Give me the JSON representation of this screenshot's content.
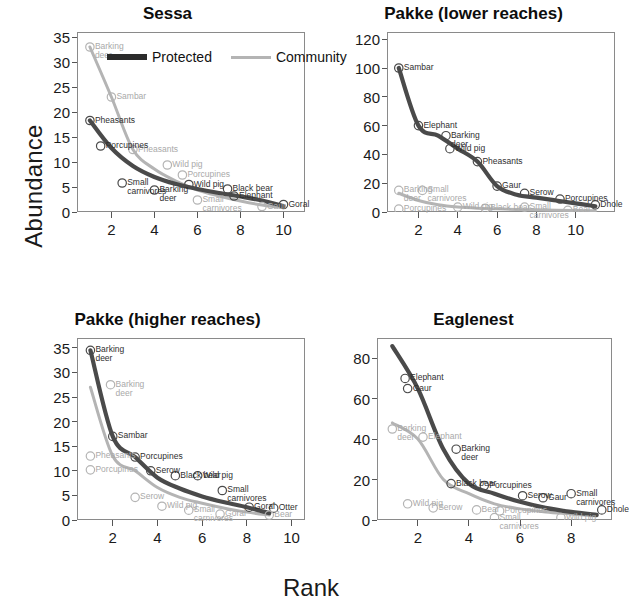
{
  "figure": {
    "ylabel": "Abundance",
    "xlabel": "Rank",
    "legend": [
      {
        "label": "Protected",
        "color": "#2b2b2b",
        "style": "thick-dark"
      },
      {
        "label": "Community",
        "color": "#b4b4b4",
        "style": "thin-light"
      }
    ]
  },
  "chart_data": [
    {
      "type": "line",
      "title": "Sessa",
      "xlabel": "Rank",
      "ylabel": "Abundance",
      "xlim": [
        0.4,
        11.0
      ],
      "ylim": [
        0,
        36
      ],
      "xticks": [
        2,
        4,
        6,
        8,
        10
      ],
      "yticks": [
        0,
        5,
        10,
        15,
        20,
        25,
        30,
        35
      ],
      "grid": false,
      "legend_position": "top-center",
      "series": [
        {
          "name": "Protected",
          "color": "#4a4a4a",
          "x": [
            1,
            2,
            3,
            4,
            5,
            6,
            7,
            8,
            9,
            10
          ],
          "values": [
            18.3,
            12.8,
            9.2,
            7.0,
            5.6,
            4.6,
            3.8,
            3.1,
            2.3,
            1.2
          ],
          "point_labels": [
            "Pheasants",
            "Porcupines",
            "Small carnivores",
            "Barking deer",
            "Wild pig",
            "Black bear",
            "Elephant",
            "Goral"
          ]
        },
        {
          "name": "Community",
          "color": "#b4b4b4",
          "x": [
            1,
            2,
            3,
            4,
            5,
            6,
            7,
            8,
            9,
            10
          ],
          "values": [
            33.0,
            23.0,
            12.5,
            8.6,
            6.2,
            4.4,
            3.2,
            2.2,
            1.4,
            0.9
          ],
          "point_labels": [
            "Barking deer",
            "Sambar",
            "Pheasants",
            "Wild pig",
            "Porcupines",
            "Small carnivores",
            "Gaur"
          ]
        }
      ],
      "annotations": [
        {
          "text": "Barking deer",
          "series": "Community",
          "x": 1,
          "y": 33.0
        },
        {
          "text": "Sambar",
          "series": "Community",
          "x": 2,
          "y": 23.0
        },
        {
          "text": "Pheasants",
          "series": "Community",
          "x": 3,
          "y": 12.5
        },
        {
          "text": "Wild pig",
          "series": "Community",
          "x": 4.6,
          "y": 9.4
        },
        {
          "text": "Porcupines",
          "series": "Community",
          "x": 5.3,
          "y": 7.4
        },
        {
          "text": "Small carnivores",
          "series": "Community",
          "x": 6,
          "y": 2.4
        },
        {
          "text": "Gaur",
          "series": "Community",
          "x": 9,
          "y": 1.1
        },
        {
          "text": "Pheasants",
          "series": "Protected",
          "x": 1,
          "y": 18.3
        },
        {
          "text": "Porcupines",
          "series": "Protected",
          "x": 1.5,
          "y": 13.2
        },
        {
          "text": "Small carnivores",
          "series": "Protected",
          "x": 2.5,
          "y": 5.8
        },
        {
          "text": "Barking deer",
          "series": "Protected",
          "x": 4,
          "y": 4.4
        },
        {
          "text": "Wild pig",
          "series": "Protected",
          "x": 5.6,
          "y": 5.5
        },
        {
          "text": "Black bear",
          "series": "Protected",
          "x": 7.4,
          "y": 4.6
        },
        {
          "text": "Elephant",
          "series": "Protected",
          "x": 7.7,
          "y": 3.2
        },
        {
          "text": "Goral",
          "series": "Protected",
          "x": 10,
          "y": 1.5
        }
      ]
    },
    {
      "type": "line",
      "title": "Pakke (lower reaches)",
      "xlabel": "Rank",
      "ylabel": "Abundance",
      "xlim": [
        0.4,
        12.0
      ],
      "ylim": [
        0,
        125
      ],
      "xticks": [
        2,
        4,
        6,
        8,
        10
      ],
      "yticks": [
        0,
        20,
        40,
        60,
        80,
        100,
        120
      ],
      "grid": false,
      "series": [
        {
          "name": "Protected",
          "color": "#4a4a4a",
          "x": [
            1,
            2,
            3,
            4,
            5,
            6,
            7,
            8,
            9,
            10,
            11
          ],
          "values": [
            100,
            60,
            53,
            44,
            35,
            18,
            12,
            10,
            8,
            6,
            4
          ],
          "point_labels": [
            "Sambar",
            "Elephant",
            "Barking deer",
            "Wild pig",
            "Pheasants",
            "Gaur",
            "Serow",
            "Porcupines",
            "Dhole"
          ]
        },
        {
          "name": "Community",
          "color": "#b4b4b4",
          "x": [
            1,
            2,
            3,
            4,
            5,
            6,
            7,
            8,
            9,
            10,
            11
          ],
          "values": [
            13,
            8,
            5,
            3.4,
            2.6,
            2.2,
            1.8,
            1.5,
            1.2,
            1.0,
            0.8
          ],
          "point_labels": [
            "Barking deer",
            "Small carnivores",
            "Porcupines",
            "Wild pig",
            "Black bear",
            "Small carnivores",
            "Bear"
          ]
        }
      ],
      "annotations": [
        {
          "text": "Sambar",
          "series": "Protected",
          "x": 1,
          "y": 100
        },
        {
          "text": "Elephant",
          "series": "Protected",
          "x": 2,
          "y": 60
        },
        {
          "text": "Barking deer",
          "series": "Protected",
          "x": 3.4,
          "y": 53
        },
        {
          "text": "Wild pig",
          "series": "Protected",
          "x": 3.6,
          "y": 44
        },
        {
          "text": "Pheasants",
          "series": "Protected",
          "x": 5,
          "y": 35
        },
        {
          "text": "Gaur",
          "series": "Protected",
          "x": 6,
          "y": 18
        },
        {
          "text": "Serow",
          "series": "Protected",
          "x": 7.4,
          "y": 13
        },
        {
          "text": "Porcupines",
          "series": "Protected",
          "x": 9.2,
          "y": 9
        },
        {
          "text": "Dhole",
          "series": "Protected",
          "x": 11,
          "y": 5
        },
        {
          "text": "Barking deer",
          "series": "Community",
          "x": 1,
          "y": 15
        },
        {
          "text": "Small carnivores",
          "series": "Community",
          "x": 2.2,
          "y": 15
        },
        {
          "text": "Porcupines",
          "series": "Community",
          "x": 1,
          "y": 2.0
        },
        {
          "text": "Wild pig",
          "series": "Community",
          "x": 4,
          "y": 3.4
        },
        {
          "text": "Black bear",
          "series": "Community",
          "x": 5.4,
          "y": 2.6
        },
        {
          "text": "Small carnivores",
          "series": "Community",
          "x": 7.4,
          "y": 3.4
        },
        {
          "text": "Bear",
          "series": "Community",
          "x": 9.6,
          "y": 1.2
        }
      ]
    },
    {
      "type": "line",
      "title": "Pakke (higher reaches)",
      "xlabel": "Rank",
      "ylabel": "Abundance",
      "xlim": [
        0.4,
        10.6
      ],
      "ylim": [
        0,
        37
      ],
      "xticks": [
        2,
        4,
        6,
        8,
        10
      ],
      "yticks": [
        0,
        5,
        10,
        15,
        20,
        25,
        30,
        35
      ],
      "grid": false,
      "series": [
        {
          "name": "Protected",
          "color": "#4a4a4a",
          "x": [
            1,
            2,
            3,
            4,
            5,
            6,
            7,
            8,
            9
          ],
          "values": [
            34.5,
            17.0,
            12.8,
            8.6,
            6.4,
            4.8,
            3.6,
            2.6,
            1.4
          ],
          "point_labels": [
            "Barking deer",
            "Sambar",
            "Porcupines",
            "Serow",
            "Black bear",
            "Wild pig",
            "Small carnivores",
            "Goral",
            "Otter"
          ]
        },
        {
          "name": "Community",
          "color": "#b4b4b4",
          "x": [
            1,
            2,
            3,
            4,
            5,
            6,
            7,
            8,
            9
          ],
          "values": [
            27.0,
            13.0,
            10.0,
            6.6,
            4.6,
            3.4,
            2.4,
            1.6,
            1.0
          ],
          "point_labels": [
            "Barking deer",
            "Pheasants",
            "Porcupines",
            "Serow",
            "Wild pig",
            "Small carnivores",
            "Goral",
            "Bear"
          ]
        }
      ],
      "annotations": [
        {
          "text": "Barking deer",
          "series": "Protected",
          "x": 1,
          "y": 34.5
        },
        {
          "text": "Barking deer",
          "series": "Community",
          "x": 1.9,
          "y": 27.5
        },
        {
          "text": "Sambar",
          "series": "Protected",
          "x": 2,
          "y": 17.0
        },
        {
          "text": "Pheasants",
          "series": "Community",
          "x": 1,
          "y": 13.0
        },
        {
          "text": "Porcupines",
          "series": "Protected",
          "x": 3,
          "y": 12.8
        },
        {
          "text": "Porcupines",
          "series": "Community",
          "x": 1,
          "y": 10.2
        },
        {
          "text": "Serow",
          "series": "Protected",
          "x": 3.7,
          "y": 10.0
        },
        {
          "text": "Black bear",
          "series": "Protected",
          "x": 4.8,
          "y": 9.0
        },
        {
          "text": "Wild pig",
          "series": "Protected",
          "x": 5.8,
          "y": 9.0
        },
        {
          "text": "Small carnivores",
          "series": "Protected",
          "x": 6.9,
          "y": 6.0
        },
        {
          "text": "Serow",
          "series": "Community",
          "x": 3.0,
          "y": 4.6
        },
        {
          "text": "Wild pig",
          "series": "Community",
          "x": 4.2,
          "y": 2.8
        },
        {
          "text": "Small carnivores",
          "series": "Community",
          "x": 5.4,
          "y": 2.0
        },
        {
          "text": "Goral",
          "series": "Community",
          "x": 6.8,
          "y": 1.2
        },
        {
          "text": "Goral",
          "series": "Protected",
          "x": 8.1,
          "y": 2.6
        },
        {
          "text": "Otter",
          "series": "Protected",
          "x": 9.2,
          "y": 2.4
        },
        {
          "text": "Bear",
          "series": "Community",
          "x": 9.0,
          "y": 1.0
        }
      ]
    },
    {
      "type": "line",
      "title": "Eaglenest",
      "xlabel": "Rank",
      "ylabel": "Abundance",
      "xlim": [
        0.4,
        9.6
      ],
      "ylim": [
        0,
        90
      ],
      "xticks": [
        2,
        4,
        6,
        8
      ],
      "yticks": [
        0,
        20,
        40,
        60,
        80
      ],
      "grid": false,
      "series": [
        {
          "name": "Protected",
          "color": "#4a4a4a",
          "x": [
            1,
            2,
            3,
            4,
            5,
            6,
            7,
            8,
            9
          ],
          "values": [
            86,
            65,
            35,
            18,
            13,
            9,
            6,
            4,
            2.5
          ],
          "point_labels": [
            "Elephant",
            "Gaur",
            "Barking deer",
            "Black bear",
            "Porcupines",
            "Serow",
            "Gaur",
            "Small carnivores",
            "Dhole"
          ]
        },
        {
          "name": "Community",
          "color": "#b4b4b4",
          "x": [
            1,
            2,
            3,
            4,
            5,
            6,
            7,
            8,
            9
          ],
          "values": [
            48,
            40,
            20,
            13,
            8,
            5.5,
            4,
            3,
            2
          ],
          "point_labels": [
            "Barking deer",
            "Elephant",
            "Wild pig",
            "Serow",
            "Bear",
            "Porcupines",
            "Small carnivores",
            "Wild pig"
          ]
        }
      ],
      "annotations": [
        {
          "text": "Elephant",
          "series": "Protected",
          "x": 1.5,
          "y": 70
        },
        {
          "text": "Gaur",
          "series": "Protected",
          "x": 1.6,
          "y": 65
        },
        {
          "text": "Barking deer",
          "series": "Protected",
          "x": 3.5,
          "y": 35
        },
        {
          "text": "Barking deer",
          "series": "Community",
          "x": 1,
          "y": 45
        },
        {
          "text": "Elephant",
          "series": "Community",
          "x": 2.2,
          "y": 41
        },
        {
          "text": "Black bear",
          "series": "Protected",
          "x": 3.3,
          "y": 18
        },
        {
          "text": "Porcupines",
          "series": "Protected",
          "x": 4.6,
          "y": 17
        },
        {
          "text": "Serow",
          "series": "Protected",
          "x": 6.1,
          "y": 12
        },
        {
          "text": "Gaur",
          "series": "Protected",
          "x": 6.9,
          "y": 11
        },
        {
          "text": "Small carnivores",
          "series": "Protected",
          "x": 8.0,
          "y": 13
        },
        {
          "text": "Dhole",
          "series": "Protected",
          "x": 9.2,
          "y": 5
        },
        {
          "text": "Wild pig",
          "series": "Community",
          "x": 1.6,
          "y": 8
        },
        {
          "text": "Serow",
          "series": "Community",
          "x": 2.6,
          "y": 6
        },
        {
          "text": "Bear",
          "series": "Community",
          "x": 4.3,
          "y": 5
        },
        {
          "text": "Porcupines",
          "series": "Community",
          "x": 5.2,
          "y": 4.5
        },
        {
          "text": "Small carnivores",
          "series": "Community",
          "x": 5.0,
          "y": 1.2
        },
        {
          "text": "Wild pig",
          "series": "Community",
          "x": 7.6,
          "y": 1.2
        }
      ]
    }
  ]
}
